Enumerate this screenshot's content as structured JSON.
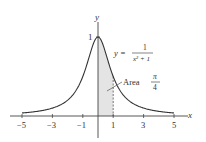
{
  "chart_data": {
    "type": "line",
    "title": "",
    "function": "y = 1/(x^2 + 1)",
    "xlabel": "x",
    "ylabel": "y",
    "xlim": [
      -5.5,
      5.5
    ],
    "ylim": [
      0,
      1.05
    ],
    "x_ticks": [
      -5,
      -3,
      -1,
      1,
      3,
      5
    ],
    "x_tick_labels": [
      "−5",
      "−3",
      "−1",
      "1",
      "3",
      "5"
    ],
    "y_ticks": [
      1
    ],
    "y_tick_labels": [
      "1"
    ],
    "series": [
      {
        "name": "y = 1/(x^2+1)",
        "x": [
          -5,
          -4,
          -3,
          -2,
          -1,
          -0.5,
          0,
          0.5,
          1,
          2,
          3,
          4,
          5
        ],
        "y": [
          0.0385,
          0.0588,
          0.1,
          0.2,
          0.5,
          0.8,
          1,
          0.8,
          0.5,
          0.2,
          0.1,
          0.0588,
          0.0385
        ]
      }
    ],
    "shaded_region": {
      "x_from": 0,
      "x_to": 1,
      "label": "Area π/4"
    },
    "annotations": [
      {
        "text": "y = 1/(x² + 1)",
        "near": [
          1.8,
          0.85
        ]
      },
      {
        "text": "Area π/4",
        "near": [
          1.6,
          0.55
        ]
      }
    ],
    "grid": false,
    "legend": "none"
  },
  "labels": {
    "x_axis": "x",
    "y_axis": "y",
    "y_one": "1",
    "eq_y": "y =",
    "eq_num": "1",
    "eq_den": "x² + 1",
    "area_word": "Area",
    "area_num": "π",
    "area_den": "4",
    "ticks": [
      "−5",
      "−3",
      "−1",
      "1",
      "3",
      "5"
    ]
  }
}
